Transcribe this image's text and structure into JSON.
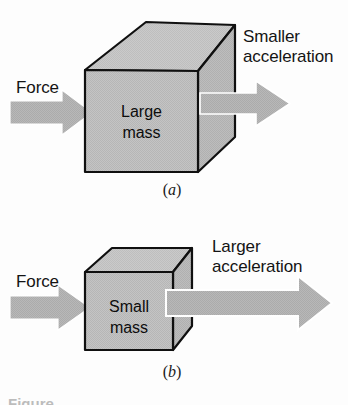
{
  "figure": {
    "type": "physics-diagram",
    "background_color": "#fdfdfd",
    "cube_fill_color": "#c2c2c2",
    "cube_top_fill_color": "#c8c8c8",
    "cube_side_fill_color": "#bcbcbc",
    "cube_outline_color": "#101010",
    "arrow_fill_color": "#b4b4b4",
    "arrow_outline_color": "#ffffff",
    "text_color": "#141414"
  },
  "panels": [
    {
      "id": "a",
      "caption": "a",
      "caption_open_paren": "(",
      "caption_close_paren": ")",
      "force_label": "Force",
      "acceleration_label": "Smaller\nacceleration",
      "acceleration_label_line1": "Smaller",
      "acceleration_label_line2": "acceleration",
      "mass_label": "Large\nmass",
      "mass_label_line1": "Large",
      "mass_label_line2": "mass",
      "mass_size": "large",
      "acceleration_magnitude": "smaller",
      "arrow_out_length_px": 78
    },
    {
      "id": "b",
      "caption": "b",
      "caption_open_paren": "(",
      "caption_close_paren": ")",
      "force_label": "Force",
      "acceleration_label": "Larger\nacceleration",
      "acceleration_label_line1": "Larger",
      "acceleration_label_line2": "acceleration",
      "mass_label": "Small\nmass",
      "mass_label_line1": "Small",
      "mass_label_line2": "mass",
      "mass_size": "small",
      "acceleration_magnitude": "larger",
      "arrow_out_length_px": 158
    }
  ],
  "clipped_caption": "Figure"
}
